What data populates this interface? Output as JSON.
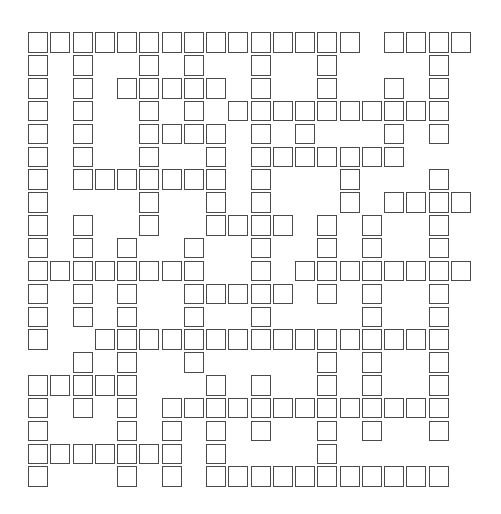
{
  "puzzle": {
    "type": "crossword-grid",
    "columns": 20,
    "rows": 20,
    "cell_fill_symbol": "#",
    "empty_symbol": ".",
    "layout": {
      "origin_x": 28,
      "origin_y": 32.3,
      "pitch_x": 22.25,
      "pitch_y": 22.85
    },
    "colors": {
      "cell_border": "#4a4a4a",
      "cell_background": "#ffffff",
      "page_background": "#ffffff"
    },
    "grid": [
      "###############.####",
      "#.#..#.#..#..#....#.",
      "#.#.#####.#..#..#.#.",
      "#.#..#.#.##########.",
      "#.#..####.#.#...#.#.",
      "#.#..#..#.#######...",
      "#.#######.#...#...#.",
      "#....#..#.#...#.####",
      "#.#..#..####.#.#..#.",
      "#.#.#..#..#..#.#..#.",
      "########..#.########",
      "#.#.#..#####.#.#..#.",
      "#.#.#..#..#....#..#.",
      "#..################.",
      "..#.#..#.....#.#..#.",
      "#####...#.#..#.#..#.",
      "#.#.#.#############.",
      "#...#.#.#.#..#.#..#.",
      "#######.#....#......",
      "#...#.#.###########."
    ]
  }
}
